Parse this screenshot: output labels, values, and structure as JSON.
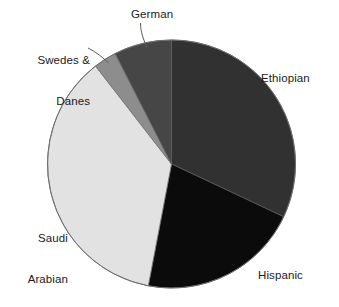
{
  "chart_data": {
    "type": "pie",
    "title": "",
    "subtitle": "",
    "xlabel": "",
    "ylabel": "",
    "legend_position": "none",
    "grid": false,
    "labels_outside": true,
    "start_angle_deg": 0,
    "direction": "clockwise",
    "categories": [
      "Ethiopian",
      "Hispanic",
      "Saudi Arabian",
      "Swedes & Danes",
      "German"
    ],
    "values": [
      32.0,
      21.0,
      36.5,
      3.0,
      7.5
    ],
    "units": "percent",
    "slices": [
      {
        "label": "Ethiopian",
        "value": 32.0,
        "color": "#313131",
        "start_angle_deg": 0.0,
        "end_angle_deg": 115.2
      },
      {
        "label": "Hispanic",
        "value": 21.0,
        "color": "#0b0b0b",
        "start_angle_deg": 115.2,
        "end_angle_deg": 190.8
      },
      {
        "label": "Saudi Arabian",
        "value": 36.5,
        "color": "#e2e2e2",
        "start_angle_deg": 190.8,
        "end_angle_deg": 322.2
      },
      {
        "label": "Swedes & Danes",
        "value": 3.0,
        "color": "#8d8d8d",
        "start_angle_deg": 322.2,
        "end_angle_deg": 333.0
      },
      {
        "label": "German",
        "value": 7.5,
        "color": "#464646",
        "start_angle_deg": 333.0,
        "end_angle_deg": 360.0
      }
    ]
  },
  "labels": {
    "ethiopian": "Ethiopian",
    "hispanic": "Hispanic",
    "saudi_arabian_line1": "Saudi",
    "saudi_arabian_line2": "Arabian",
    "swedes_danes_line1": "Swedes &",
    "swedes_danes_line2": "Danes",
    "german": "German"
  },
  "colors": {
    "background": "#ffffff",
    "outline": "#6e6e6e",
    "leader_line": "#5a5a5a",
    "text": "#1a1a1a",
    "ethiopian": "#313131",
    "hispanic": "#0b0b0b",
    "saudi_arabian": "#e2e2e2",
    "swedes_danes": "#8d8d8d",
    "german": "#464646"
  },
  "geometry": {
    "center_x": 171.5,
    "center_y": 164,
    "radius": 124
  }
}
